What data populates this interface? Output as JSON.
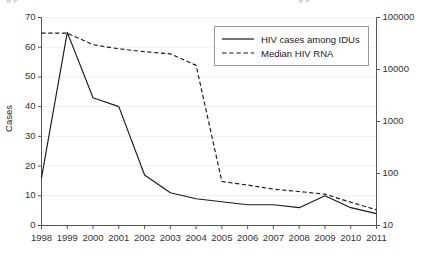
{
  "figure": {
    "top_crop_remnant": "g p",
    "background_color": "#ffffff",
    "line_color": "#1a1a1a",
    "grid_color": "#eeeeee",
    "axis_color": "#555555"
  },
  "legend": {
    "position": "top-center-right",
    "entries": [
      {
        "label": "HIV cases among IDUs",
        "style": "solid"
      },
      {
        "label": "Median HIV RNA",
        "style": "dashed"
      }
    ]
  },
  "chart_data": {
    "type": "line",
    "title": "",
    "xlabel": "",
    "ylabel": "Cases",
    "y2label": "HIV RNA (copies/ml)",
    "grid": true,
    "x": [
      1998,
      1999,
      2000,
      2001,
      2002,
      2003,
      2004,
      2005,
      2006,
      2007,
      2008,
      2009,
      2010,
      2011
    ],
    "categories": [
      "1998",
      "1999",
      "2000",
      "2001",
      "2002",
      "2003",
      "2004",
      "2005",
      "2006",
      "2007",
      "2008",
      "2009",
      "2010",
      "2011"
    ],
    "xlim": [
      1998,
      2011
    ],
    "ylim": [
      0,
      70
    ],
    "yticks": [
      0,
      10,
      20,
      30,
      40,
      50,
      60,
      70
    ],
    "y2_scale": "log",
    "y2lim": [
      10,
      100000
    ],
    "y2ticks": [
      10,
      100,
      1000,
      10000,
      100000
    ],
    "y2ticklabels": [
      "10",
      "100",
      "1000",
      "10000",
      "100000"
    ],
    "series": [
      {
        "name": "HIV cases among IDUs",
        "style": "solid",
        "axis": "left",
        "units": "cases",
        "values": [
          16,
          65,
          43,
          40,
          17,
          11,
          9,
          8,
          7,
          7,
          6,
          10,
          6,
          4
        ]
      },
      {
        "name": "Median HIV RNA",
        "style": "dashed",
        "axis": "right",
        "units": "copies/ml",
        "values": [
          50000,
          50000,
          30000,
          25000,
          22000,
          20000,
          12000,
          70,
          60,
          50,
          45,
          40,
          28,
          20
        ]
      }
    ]
  }
}
